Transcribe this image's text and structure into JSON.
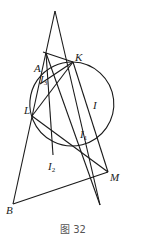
{
  "figure": {
    "caption": "图 32",
    "labels": {
      "A": "A",
      "K": "K",
      "L": "L",
      "I": "I",
      "I1": "I",
      "I1_sub": "1",
      "I2": "I",
      "I2_sub": "2",
      "M": "M",
      "B": "B",
      "A_inner": "I",
      "A_inner_sub": "3"
    },
    "points": {
      "apex": [
        55,
        11
      ],
      "A": [
        45,
        50
      ],
      "P": [
        46,
        53
      ],
      "K": [
        73,
        62
      ],
      "L": [
        32,
        116
      ],
      "M": [
        108,
        172
      ],
      "B": [
        13,
        204
      ],
      "I1": [
        77,
        148
      ],
      "I2": [
        53,
        156
      ],
      "T": [
        88,
        177
      ]
    },
    "circle": {
      "cx": 95,
      "cy": 116,
      "r": 42
    },
    "colors": {
      "stroke": "#1a1a1a",
      "text": "#222222",
      "caption": "#555555"
    }
  }
}
